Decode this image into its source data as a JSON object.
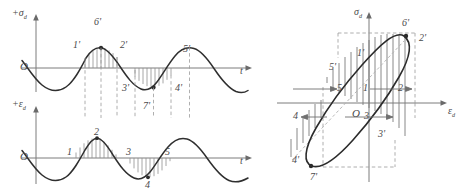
{
  "figure": {
    "kind": "engineering-diagram",
    "ink_color": "#2f2f2f",
    "axis_color": "#7d7d7d",
    "dash_color": "#9a9a9a",
    "hatch_color": "#8f8f8f"
  },
  "panels": {
    "stress_wave": {
      "y_axis_label": "+σ",
      "y_axis_sub": "d",
      "x_axis_label": "t",
      "origin_label": "O",
      "point_labels": [
        "1'",
        "6'",
        "2'",
        "3'",
        "7'",
        "4'",
        "5'"
      ]
    },
    "strain_wave": {
      "y_axis_label": "+ε",
      "y_axis_sub": "d",
      "x_axis_label": "t",
      "origin_label": "O",
      "point_labels": [
        "1",
        "2",
        "3",
        "4",
        "5"
      ]
    },
    "hysteresis": {
      "y_axis_label": "σ",
      "y_axis_sub": "d",
      "x_axis_label": "ε",
      "x_axis_sub": "d",
      "origin_label": "O",
      "outer_labels": [
        "6'",
        "2'",
        "4'",
        "7'"
      ],
      "inner_labels": [
        "1'",
        "5'",
        "3'"
      ],
      "axis_point_labels": [
        "5",
        "1",
        "2",
        "4",
        "3"
      ]
    }
  },
  "labels": {
    "s1p": "1'",
    "s6p": "6'",
    "s2p": "2'",
    "s3p": "3'",
    "s7p": "7'",
    "s4p": "4'",
    "s5p": "5'",
    "e1": "1",
    "e2": "2",
    "e3": "3",
    "e4": "4",
    "e5": "5",
    "h6p": "6'",
    "h2p": "2'",
    "h1p": "1'",
    "h5p": "5'",
    "h3p": "3'",
    "h4p": "4'",
    "h7p": "7'",
    "h5": "5",
    "h1": "1",
    "h2": "2",
    "h4": "4",
    "h3": "3",
    "origin_upper": "O",
    "origin_lower": "O",
    "origin_loop": "O",
    "t_upper": "t",
    "t_lower": "t",
    "sigma": "σ",
    "epsilon": "ε",
    "sub_d": "d",
    "plus": "+"
  }
}
